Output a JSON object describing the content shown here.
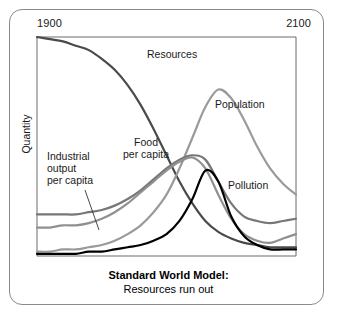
{
  "figure": {
    "caption_main": "Standard World Model:",
    "caption_sub": "Resources run out",
    "frame_color": "#8a8a8a",
    "background": "#ffffff"
  },
  "axes": {
    "y_label": "Quantity",
    "x_start_label": "1900",
    "x_end_label": "2100",
    "axis_color": "#6b6b6b",
    "plot_left": 37,
    "plot_top": 37,
    "plot_right": 296,
    "plot_bottom": 256
  },
  "labels": {
    "resources": "Resources",
    "population": "Population",
    "pollution": "Pollution",
    "food": "Food\nper capita",
    "industrial": "Industrial\noutput\nper capita"
  },
  "chart_data": {
    "type": "line",
    "title": "Standard World Model: Resources run out",
    "xlabel": "",
    "ylabel": "Quantity",
    "xlim": [
      1900,
      2100
    ],
    "xtick_labels": [
      "1900",
      "2100"
    ],
    "ytick_labels": [],
    "grid": false,
    "legend": "inline-annotations",
    "x": [
      1900,
      1910,
      1920,
      1930,
      1940,
      1950,
      1960,
      1970,
      1980,
      1990,
      2000,
      2010,
      2020,
      2030,
      2040,
      2050,
      2060,
      2070,
      2080,
      2090,
      2100
    ],
    "series": [
      {
        "name": "Resources",
        "color": "#4a4a4a",
        "width": 2.2,
        "values": [
          100,
          99,
          98,
          96,
          94,
          90,
          85,
          78,
          69,
          58,
          46,
          34,
          24,
          16,
          11,
          8,
          6,
          5,
          4,
          4,
          4
        ]
      },
      {
        "name": "Population",
        "color": "#9a9a9a",
        "width": 2.2,
        "values": [
          2,
          2,
          3,
          3,
          4,
          5,
          7,
          10,
          14,
          20,
          28,
          40,
          54,
          68,
          76,
          72,
          62,
          50,
          40,
          33,
          28
        ]
      },
      {
        "name": "Food per capita",
        "color": "#777777",
        "width": 2.2,
        "values": [
          19,
          19,
          19,
          19,
          20,
          21,
          23,
          26,
          30,
          35,
          40,
          44,
          46,
          44,
          34,
          24,
          18,
          16,
          15,
          16,
          17
        ]
      },
      {
        "name": "Industrial output per capita",
        "color": "#909090",
        "width": 2.2,
        "values": [
          13,
          13,
          14,
          14,
          15,
          17,
          20,
          24,
          29,
          34,
          39,
          43,
          45,
          40,
          28,
          17,
          10,
          7,
          6,
          8,
          10
        ]
      },
      {
        "name": "Pollution",
        "color": "#000000",
        "width": 2.2,
        "values": [
          1,
          1,
          1,
          1,
          2,
          2,
          3,
          4,
          5,
          7,
          10,
          16,
          26,
          39,
          34,
          18,
          9,
          5,
          3,
          3,
          3
        ]
      }
    ],
    "annotations": [
      {
        "text": "Resources",
        "x": 1985,
        "y": 88
      },
      {
        "text": "Population",
        "x": 2035,
        "y": 66
      },
      {
        "text": "Pollution",
        "x": 2048,
        "y": 36
      },
      {
        "text": "Food per capita",
        "x": 1972,
        "y": 56
      },
      {
        "text": "Industrial output per capita",
        "x": 1912,
        "y": 50,
        "leader_line": true
      }
    ]
  }
}
